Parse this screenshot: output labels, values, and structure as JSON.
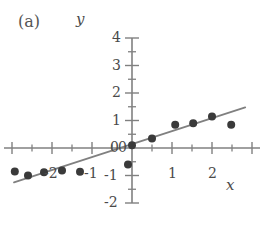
{
  "figure": {
    "panel_label": "(a)",
    "x_axis_name": "x",
    "y_axis_name": "y"
  },
  "chart_data": {
    "type": "scatter",
    "title": "(a)",
    "xlabel": "x",
    "ylabel": "y",
    "xlim": [
      -3.2,
      3.2
    ],
    "ylim": [
      -2.0,
      4.0
    ],
    "grid": false,
    "legend": null,
    "x_ticks_major": [
      -3,
      -2,
      -1,
      0,
      1,
      2,
      3
    ],
    "x_tick_labels": [
      "",
      "-2",
      "-1",
      "0",
      "1",
      "2",
      ""
    ],
    "x_ticks_minor": [
      -2.5,
      -1.5,
      -0.5,
      0.5,
      1.5,
      2.5
    ],
    "y_ticks_major": [
      -2,
      -1,
      0,
      1,
      2,
      3,
      4
    ],
    "y_tick_labels": [
      "-2",
      "-1",
      "0",
      "1",
      "2",
      "3",
      "4"
    ],
    "y_ticks_minor": [
      -1.5,
      -0.5,
      0.5,
      1.5,
      2.5,
      3.5
    ],
    "points": [
      {
        "x": -2.93,
        "y": -0.85
      },
      {
        "x": -2.6,
        "y": -1.0
      },
      {
        "x": -2.2,
        "y": -0.88
      },
      {
        "x": -1.75,
        "y": -0.82
      },
      {
        "x": -1.3,
        "y": -0.86
      },
      {
        "x": -0.1,
        "y": -0.6
      },
      {
        "x": 0.0,
        "y": 0.1
      },
      {
        "x": 0.5,
        "y": 0.35
      },
      {
        "x": 1.08,
        "y": 0.85
      },
      {
        "x": 1.53,
        "y": 0.9
      },
      {
        "x": 2.0,
        "y": 1.15
      },
      {
        "x": 2.48,
        "y": 0.85
      }
    ],
    "point_color": "#3a3a3a",
    "point_size": 8,
    "fit_line": {
      "x_start": -2.95,
      "y_start": -1.25,
      "x_end": 2.83,
      "y_end": 1.48,
      "slope": 0.47,
      "intercept": 0.14,
      "color": "#808080"
    },
    "axis_color": "#808080"
  }
}
